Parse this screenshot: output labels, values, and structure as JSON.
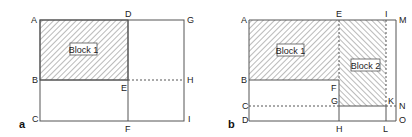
{
  "panels": [
    {
      "id": "a",
      "label": "a",
      "points": {
        "A": "A",
        "B": "B",
        "C": "C",
        "D": "D",
        "E": "E",
        "F": "F",
        "G": "G",
        "H": "H",
        "I": "I"
      },
      "blocks": [
        {
          "label": "Block 1"
        }
      ]
    },
    {
      "id": "b",
      "label": "b",
      "points": {
        "A": "A",
        "B": "B",
        "C": "C",
        "D": "D",
        "E": "E",
        "F": "F",
        "G": "G",
        "H": "H",
        "I": "I",
        "K": "K",
        "L": "L",
        "M": "M",
        "N": "N",
        "O": "O"
      },
      "blocks": [
        {
          "label": "Block 1"
        },
        {
          "label": "Block 2"
        }
      ]
    }
  ],
  "colors": {
    "line": "#555555",
    "hatch": "#666666",
    "text": "#222222",
    "background": "#ffffff"
  }
}
